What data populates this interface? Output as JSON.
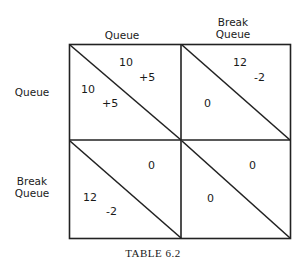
{
  "matrix": {
    "column_headers": [
      "Queue",
      "Break\nQueue"
    ],
    "row_headers": [
      "Queue",
      "Break\nQueue"
    ],
    "col_header_lines": [
      [
        "Queue"
      ],
      [
        "Break",
        "Queue"
      ]
    ],
    "row_header_lines": [
      [
        "Queue"
      ],
      [
        "Break",
        "Queue"
      ]
    ],
    "cells": [
      [
        {
          "upper_right": "10",
          "upper_right_delta": "+5",
          "lower_left": "10",
          "lower_left_delta": "+5"
        },
        {
          "upper_right": "12",
          "upper_right_delta": "-2",
          "lower_left": "0",
          "lower_left_delta": ""
        }
      ],
      [
        {
          "upper_right": "0",
          "upper_right_delta": "",
          "lower_left": "12",
          "lower_left_delta": "-2"
        },
        {
          "upper_right": "0",
          "upper_right_delta": "",
          "lower_left": "0",
          "lower_left_delta": ""
        }
      ]
    ]
  },
  "caption": "TABLE 6.2"
}
